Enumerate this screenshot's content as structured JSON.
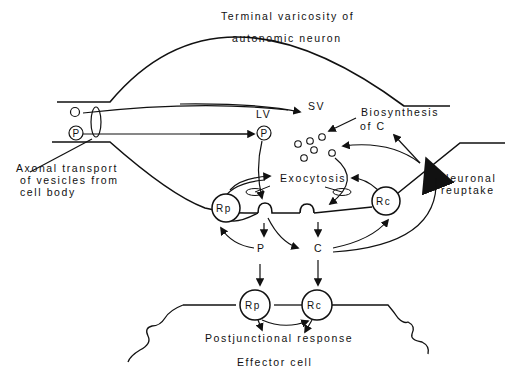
{
  "labels": {
    "title_line1": "Terminal varicosity of",
    "title_line2": "autonomic neuron",
    "sv": "SV",
    "lv": "LV",
    "biosynthesis_line1": "Biosynthesis",
    "biosynthesis_line2": "of C",
    "axonal_line1": "Axonal transport",
    "axonal_line2": "of vesicles from",
    "axonal_line3": "cell body",
    "exocytosis": "Exocytosis",
    "neuronal_line1": "Neuronal",
    "neuronal_line2": "reuptake",
    "p_free": "P",
    "c_free": "C",
    "postjunctional": "Postjunctional response",
    "effector": "Effector cell"
  },
  "nodes": {
    "axon_p_vesicle": "P",
    "lv_p_vesicle": "P",
    "prejunctional_rp": "Rp",
    "prejunctional_rc": "Rc",
    "postjunctional_rp": "Rp",
    "postjunctional_rc": "Rc"
  },
  "colors": {
    "line": "#111111",
    "background": "#ffffff"
  }
}
